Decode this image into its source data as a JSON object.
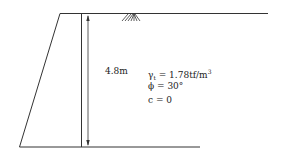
{
  "diagram": {
    "height_label": "4.8m",
    "properties": {
      "gamma_symbol": "γ",
      "gamma_subscript": "t",
      "gamma_value": "= 1.78tf/m",
      "gamma_unit_exp": "3",
      "phi": "ϕ = 30°",
      "c": "c = 0"
    },
    "ground_surface_symbol": "hatch"
  }
}
